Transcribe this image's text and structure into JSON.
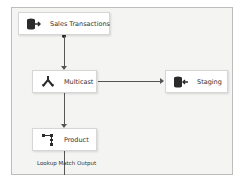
{
  "diagram": {
    "type": "data-flow",
    "nodes": [
      {
        "id": "sales",
        "label": "Sales Transactions",
        "icon": "source-database-icon"
      },
      {
        "id": "multicast",
        "label": "Multicast",
        "icon": "multicast-split-icon"
      },
      {
        "id": "staging",
        "label": "Staging",
        "icon": "destination-database-icon"
      },
      {
        "id": "product",
        "label": "Product",
        "icon": "lookup-icon"
      }
    ],
    "edges": [
      {
        "from": "sales",
        "to": "multicast",
        "label": ""
      },
      {
        "from": "multicast",
        "to": "staging",
        "label": ""
      },
      {
        "from": "multicast",
        "to": "product",
        "label": ""
      },
      {
        "from": "product",
        "to": "",
        "label": "Lookup Match Output"
      }
    ],
    "colors": {
      "canvas": "#f4f4f2",
      "node_bg": "#ffffff",
      "connector": "#555555",
      "icon": "#2b2b2b"
    }
  }
}
